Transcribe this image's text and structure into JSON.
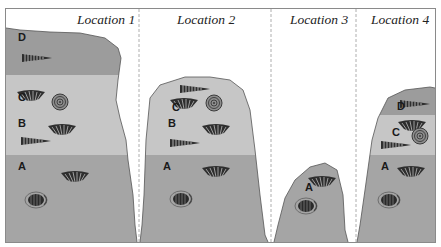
{
  "diagram": {
    "type": "rock-strata-comparison",
    "colors": {
      "layer_D": "#9c9c9c",
      "layer_C": "#c6c6c6",
      "layer_B": "#c6c6c6",
      "layer_A": "#a5a5a5",
      "frame": "#8a8a8a",
      "fossil": "#2e2e2e"
    },
    "locations": [
      {
        "title": "Location 1",
        "layers": [
          "D",
          "C",
          "B",
          "A"
        ],
        "fossils": {
          "D": [
            "tooth-shell"
          ],
          "C": [
            "fan-shell",
            "ammonite"
          ],
          "B": [
            "fan-shell",
            "tooth-shell"
          ],
          "A": [
            "fan-shell",
            "trilobite"
          ]
        }
      },
      {
        "title": "Location 2",
        "layers": [
          "C",
          "B",
          "A"
        ],
        "fossils": {
          "C": [
            "tooth-shell",
            "fan-shell",
            "ammonite"
          ],
          "B": [
            "fan-shell",
            "tooth-shell"
          ],
          "A": [
            "fan-shell",
            "trilobite"
          ]
        }
      },
      {
        "title": "Location 3",
        "layers": [
          "A"
        ],
        "fossils": {
          "A": [
            "fan-shell",
            "trilobite"
          ]
        }
      },
      {
        "title": "Location 4",
        "layers": [
          "D",
          "C",
          "A"
        ],
        "fossils": {
          "D": [
            "tooth-shell"
          ],
          "C": [
            "fan-shell",
            "ammonite",
            "tooth-shell"
          ],
          "A": [
            "fan-shell",
            "trilobite"
          ]
        }
      }
    ],
    "labels": {
      "L1_D": "D",
      "L1_C": "C",
      "L1_B": "B",
      "L1_A": "A",
      "L2_C": "C",
      "L2_B": "B",
      "L2_A": "A",
      "L3_A": "A",
      "L4_D": "D",
      "L4_C": "C",
      "L4_A": "A"
    }
  }
}
